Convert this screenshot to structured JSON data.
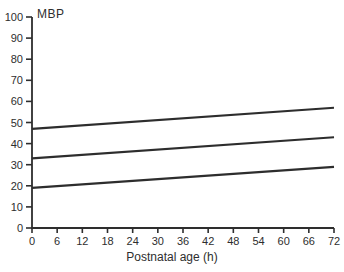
{
  "chart_data": {
    "type": "line",
    "title": "",
    "ylabel": "MBP",
    "xlabel": "Postnatal age (h)",
    "xlim": [
      0,
      72
    ],
    "ylim": [
      0,
      100
    ],
    "x_ticks": [
      0,
      6,
      12,
      18,
      24,
      30,
      36,
      42,
      48,
      54,
      60,
      66,
      72
    ],
    "y_ticks": [
      0,
      10,
      20,
      30,
      40,
      50,
      60,
      70,
      80,
      90,
      100
    ],
    "grid": false,
    "legend_position": "none",
    "series": [
      {
        "name": "upper-percentile-line",
        "x": [
          0,
          72
        ],
        "values": [
          47,
          57
        ]
      },
      {
        "name": "median-line",
        "x": [
          0,
          72
        ],
        "values": [
          33,
          43
        ]
      },
      {
        "name": "lower-percentile-line",
        "x": [
          0,
          72
        ],
        "values": [
          19,
          29
        ]
      }
    ],
    "colors": {
      "line": "#2d2d2d",
      "axis": "#2e2e2e",
      "text": "#2e2e2e",
      "background": "#ffffff"
    }
  }
}
